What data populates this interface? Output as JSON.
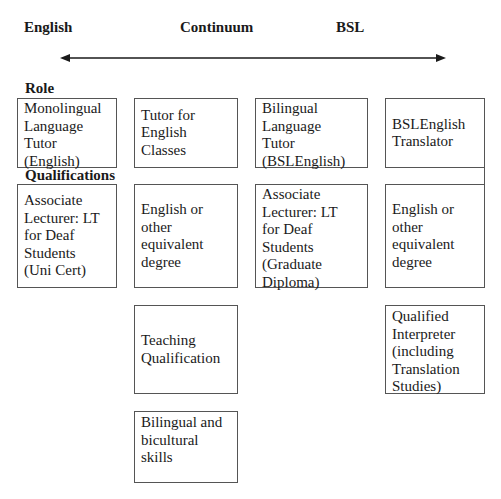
{
  "headings": {
    "left": "English",
    "middle": "Continuum",
    "right": "BSL"
  },
  "arrow": {
    "type": "double-headed",
    "from": "English",
    "to": "BSL",
    "color": "#1a1a1a"
  },
  "sections": {
    "role": "Role",
    "qualifications": "Qualifications"
  },
  "boxes": {
    "role_monolingual": {
      "lines": [
        "Monolingual",
        "Language",
        "Tutor",
        "(English)"
      ]
    },
    "role_tutor_english": {
      "lines": [
        "Tutor for",
        "English",
        "Classes"
      ]
    },
    "role_bilingual": {
      "lines": [
        "Bilingual",
        "Language",
        "Tutor",
        "(BSLEnglish)"
      ]
    },
    "role_translator": {
      "lines": [
        "BSLEnglish",
        "Translator"
      ]
    },
    "qual_assoc_unicert": {
      "lines": [
        "Associate",
        "Lecturer: LT",
        "for Deaf",
        "Students",
        "(Uni Cert)"
      ]
    },
    "qual_degree_col2": {
      "lines": [
        "English or",
        "other",
        "equivalent",
        "degree"
      ]
    },
    "qual_assoc_graddip": {
      "lines": [
        "Associate",
        "Lecturer: LT",
        "for Deaf",
        "Students",
        "(Graduate",
        "Diploma)"
      ]
    },
    "qual_degree_col4": {
      "lines": [
        "English or",
        "other",
        "equivalent",
        "degree"
      ]
    },
    "qual_teaching": {
      "lines": [
        "Teaching",
        "Qualification"
      ]
    },
    "qual_interpreter": {
      "lines": [
        "Qualified",
        "Interpreter",
        "(including",
        "Translation",
        "Studies)"
      ]
    },
    "qual_bilingual_skills": {
      "lines": [
        "Bilingual and",
        "bicultural",
        "skills"
      ]
    }
  }
}
